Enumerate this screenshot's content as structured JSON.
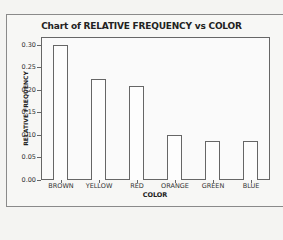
{
  "chart_data": {
    "type": "bar",
    "title": "Chart of RELATIVE FREQUENCY vs COLOR",
    "xlabel": "COLOR",
    "ylabel": "RELATIVE FREQUENCY",
    "categories": [
      "BROWN",
      "YELLOW",
      "RED",
      "ORANGE",
      "GREEN",
      "BLUE"
    ],
    "values": [
      0.3,
      0.224,
      0.209,
      0.1,
      0.087,
      0.087
    ],
    "ylim": [
      0,
      0.31
    ],
    "yticks": [
      "0.00",
      "0.05",
      "0.10",
      "0.15",
      "0.20",
      "0.25",
      "0.30"
    ],
    "grid": false,
    "legend": null
  }
}
